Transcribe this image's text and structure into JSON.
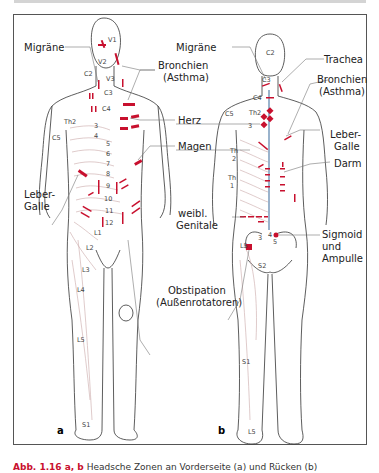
{
  "figure": {
    "panels": [
      {
        "id": "a",
        "label": "a",
        "view": "front",
        "labels": {
          "migraene": "Migräne",
          "bronchien": "Bronchien",
          "asthma": "(Asthma)",
          "herz": "Herz",
          "magen": "Magen",
          "leber": "Leber-",
          "galle": "Galle",
          "obstipation": "Obstipation",
          "aussenrotatoren": "(Außenrotatoren)"
        },
        "segments": {
          "v1": "V1",
          "v2": "V2",
          "v3": "V3",
          "c2": "C2",
          "c3": "C3",
          "c4": "C4",
          "c5": "C5",
          "th2": "Th2",
          "t3": "3",
          "t4": "4",
          "t5": "5",
          "t6": "6",
          "t7": "7",
          "t8": "8",
          "t9": "9",
          "t10": "10",
          "t11": "11",
          "t12": "12",
          "l1": "L1",
          "l2": "L2",
          "l3": "L3",
          "l4": "L4",
          "l5": "L5",
          "s1": "S1"
        }
      },
      {
        "id": "b",
        "label": "b",
        "view": "back",
        "labels": {
          "migraene": "Migräne",
          "trachea": "Trachea",
          "bronchien": "Bronchien",
          "asthma": "(Asthma)",
          "leber": "Leber-",
          "galle": "Galle",
          "darm": "Darm",
          "genitale1": "weibl.",
          "genitale2": "Genitale",
          "sigmoid1": "Sigmoid",
          "sigmoid2": "und",
          "sigmoid3": "Ampulle"
        },
        "segments": {
          "c2": "C2",
          "c3": "C3",
          "c4": "C4",
          "c5": "C5",
          "th2": "Th2",
          "t3": "3",
          "th1": "Th",
          "th1n": "1",
          "th2b": "Th",
          "th2n": "2",
          "l5": "L5",
          "s2": "S2",
          "s1": "S1",
          "l5foot": "L5",
          "s3": "3",
          "s4": "4",
          "s5": "5"
        }
      }
    ],
    "caption": {
      "prefix": "Abb. 1.16 a, b",
      "text": " Headsche Zonen an Vorderseite (a) und Rücken (b)"
    },
    "colors": {
      "zone": "#c8102e",
      "outline": "#333333",
      "dermatome": "#c9a8a8",
      "leader": "#777777"
    }
  }
}
